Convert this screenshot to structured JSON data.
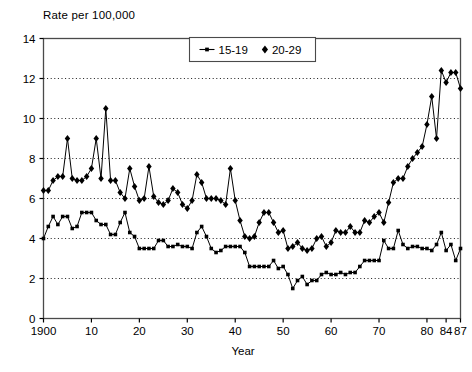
{
  "chart_data": {
    "type": "line",
    "title": "",
    "ylabel": "Rate per 100,000",
    "xlabel": "Year",
    "ylim": [
      0,
      14
    ],
    "xlim": [
      1900,
      1987
    ],
    "yticks": [
      0,
      2,
      4,
      6,
      8,
      10,
      12,
      14
    ],
    "xticks": [
      1900,
      1910,
      1920,
      1930,
      1940,
      1950,
      1960,
      1970,
      1980,
      1984,
      1987
    ],
    "xticklabels": [
      "1900",
      "10",
      "20",
      "30",
      "40",
      "50",
      "60",
      "70",
      "80",
      "84",
      "87"
    ],
    "grid": "horizontal-dotted",
    "legend_position": "top-center",
    "series": [
      {
        "name": "15-19",
        "marker": "square",
        "color": "#000000",
        "x": [
          1900,
          1901,
          1902,
          1903,
          1904,
          1905,
          1906,
          1907,
          1908,
          1909,
          1910,
          1911,
          1912,
          1913,
          1914,
          1915,
          1916,
          1917,
          1918,
          1919,
          1920,
          1921,
          1922,
          1923,
          1924,
          1925,
          1926,
          1927,
          1928,
          1929,
          1930,
          1931,
          1932,
          1933,
          1934,
          1935,
          1936,
          1937,
          1938,
          1939,
          1940,
          1941,
          1942,
          1943,
          1944,
          1945,
          1946,
          1947,
          1948,
          1949,
          1950,
          1951,
          1952,
          1953,
          1954,
          1955,
          1956,
          1957,
          1958,
          1959,
          1960,
          1961,
          1962,
          1963,
          1964,
          1965,
          1966,
          1967,
          1968,
          1969,
          1970,
          1971,
          1972,
          1973,
          1974,
          1975,
          1976,
          1977,
          1978,
          1979,
          1980,
          1981,
          1982,
          1983,
          1984,
          1985,
          1986,
          1987
        ],
        "y": [
          4.0,
          4.6,
          5.1,
          4.7,
          5.1,
          5.1,
          4.5,
          4.6,
          5.3,
          5.3,
          5.3,
          4.9,
          4.7,
          4.7,
          4.2,
          4.2,
          4.8,
          5.3,
          4.3,
          4.1,
          3.5,
          3.5,
          3.5,
          3.5,
          3.9,
          3.9,
          3.6,
          3.6,
          3.7,
          3.6,
          3.6,
          3.5,
          4.3,
          4.6,
          4.1,
          3.5,
          3.3,
          3.4,
          3.6,
          3.6,
          3.6,
          3.6,
          3.3,
          2.6,
          2.6,
          2.6,
          2.6,
          2.6,
          2.9,
          2.5,
          2.6,
          2.2,
          1.5,
          1.9,
          2.1,
          1.7,
          1.9,
          1.9,
          2.2,
          2.3,
          2.2,
          2.2,
          2.3,
          2.2,
          2.3,
          2.3,
          2.6,
          2.9,
          2.9,
          2.9,
          2.9,
          3.9,
          3.5,
          3.5,
          4.4,
          3.7,
          3.5,
          3.6,
          3.6,
          3.5,
          3.5,
          3.4,
          3.7,
          4.3,
          3.4,
          3.7,
          2.9,
          3.5
        ]
      },
      {
        "name": "20-29",
        "marker": "diamond",
        "color": "#000000",
        "x": [
          1900,
          1901,
          1902,
          1903,
          1904,
          1905,
          1906,
          1907,
          1908,
          1909,
          1910,
          1911,
          1912,
          1913,
          1914,
          1915,
          1916,
          1917,
          1918,
          1919,
          1920,
          1921,
          1922,
          1923,
          1924,
          1925,
          1926,
          1927,
          1928,
          1929,
          1930,
          1931,
          1932,
          1933,
          1934,
          1935,
          1936,
          1937,
          1938,
          1939,
          1940,
          1941,
          1942,
          1943,
          1944,
          1945,
          1946,
          1947,
          1948,
          1949,
          1950,
          1951,
          1952,
          1953,
          1954,
          1955,
          1956,
          1957,
          1958,
          1959,
          1960,
          1961,
          1962,
          1963,
          1964,
          1965,
          1966,
          1967,
          1968,
          1969,
          1970,
          1971,
          1972,
          1973,
          1974,
          1975,
          1976,
          1977,
          1978,
          1979,
          1980,
          1981,
          1982,
          1983,
          1984,
          1985,
          1986,
          1987
        ],
        "y": [
          6.4,
          6.4,
          6.9,
          7.1,
          7.1,
          9.0,
          7.0,
          6.9,
          6.9,
          7.1,
          7.5,
          9.0,
          7.0,
          10.5,
          6.9,
          6.9,
          6.3,
          6.0,
          7.5,
          6.6,
          5.9,
          6.0,
          7.6,
          6.1,
          5.8,
          5.7,
          5.9,
          6.5,
          6.3,
          5.7,
          5.5,
          5.9,
          7.2,
          6.8,
          6.0,
          6.0,
          6.0,
          5.9,
          5.7,
          7.5,
          5.9,
          4.9,
          4.1,
          4.0,
          4.1,
          4.8,
          5.3,
          5.3,
          4.8,
          4.3,
          4.4,
          3.5,
          3.6,
          3.8,
          3.5,
          3.4,
          3.5,
          4.0,
          4.1,
          3.6,
          3.8,
          4.4,
          4.3,
          4.3,
          4.6,
          4.3,
          4.3,
          4.9,
          4.8,
          5.1,
          5.3,
          4.8,
          5.8,
          6.8,
          7.0,
          7.0,
          7.6,
          8.0,
          8.3,
          8.6,
          9.7,
          11.1,
          9.0,
          12.4,
          11.8,
          12.3,
          12.3,
          11.5
        ]
      }
    ]
  },
  "legend": {
    "items": [
      {
        "label": "15-19",
        "marker": "square"
      },
      {
        "label": "20-29",
        "marker": "diamond"
      }
    ]
  },
  "axes": {
    "y_title": "Rate per 100,000",
    "x_title": "Year"
  }
}
